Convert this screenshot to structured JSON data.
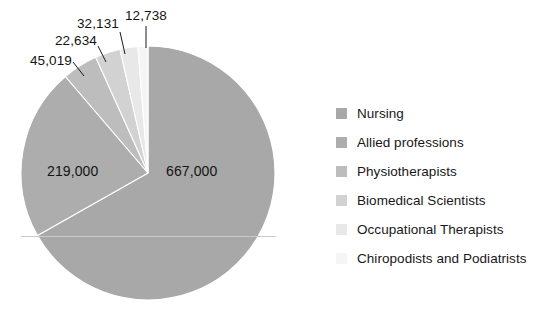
{
  "chart_data": {
    "type": "pie",
    "title": "",
    "subtitle": "",
    "xlabel": "",
    "ylabel": "",
    "legend_position": "right",
    "grid": false,
    "total": 998522,
    "categories": [
      "Nursing",
      "Allied professions",
      "Physiotherapists",
      "Biomedical Scientists",
      "Occupational Therapists",
      "Chiropodists and Podiatrists"
    ],
    "values": [
      667000,
      219000,
      45019,
      32131,
      22634,
      12738
    ],
    "labels": [
      "667,000",
      "219,000",
      "45,019",
      "32,131",
      "22,634",
      "12,738"
    ],
    "percentages": [
      66.8,
      21.93,
      4.51,
      3.22,
      2.27,
      1.28
    ],
    "colors": [
      "#a8a8a8",
      "#adadad",
      "#bdbdbd",
      "#d2d2d2",
      "#e8e8e8",
      "#f5f5f5"
    ],
    "slices": [
      {
        "name": "Nursing",
        "value": 667000,
        "label": "667,000",
        "color": "#a8a8a8",
        "percent": 66.8,
        "start_deg": 0.0,
        "sweep_deg": 240.48
      },
      {
        "name": "Allied professions",
        "value": 219000,
        "label": "219,000",
        "color": "#adadad",
        "percent": 21.93,
        "start_deg": 240.48,
        "sweep_deg": 78.96
      },
      {
        "name": "Physiotherapists",
        "value": 45019,
        "label": "45,019",
        "color": "#bdbdbd",
        "percent": 4.51,
        "start_deg": 319.44,
        "sweep_deg": 16.23
      },
      {
        "name": "Biomedical Scientists",
        "value": 32131,
        "label": "32,131",
        "color": "#d2d2d2",
        "percent": 3.22,
        "start_deg": 335.67,
        "sweep_deg": 11.58
      },
      {
        "name": "Occupational Therapists",
        "value": 22634,
        "label": "22,634",
        "color": "#e8e8e8",
        "percent": 2.27,
        "start_deg": 347.25,
        "sweep_deg": 8.16
      },
      {
        "name": "Chiropodists and Podiatrists",
        "value": 12738,
        "label": "12,738",
        "color": "#f5f5f5",
        "percent": 1.28,
        "start_deg": 355.41,
        "sweep_deg": 4.59
      }
    ]
  },
  "legend": {
    "items": [
      {
        "label": "Nursing",
        "color": "#a8a8a8"
      },
      {
        "label": "Allied professions",
        "color": "#adadad"
      },
      {
        "label": "Physiotherapists",
        "color": "#bdbdbd"
      },
      {
        "label": "Biomedical Scientists",
        "color": "#d2d2d2"
      },
      {
        "label": "Occupational Therapists",
        "color": "#e8e8e8"
      },
      {
        "label": "Chiropodists and Podiatrists",
        "color": "#f5f5f5"
      }
    ]
  },
  "value_labels": [
    {
      "text": "667,000",
      "x": 166,
      "y": 163,
      "placement": "inside"
    },
    {
      "text": "219,000",
      "x": 47,
      "y": 163,
      "placement": "inside"
    },
    {
      "text": "45,019",
      "x": 30,
      "y": 53,
      "placement": "outside"
    },
    {
      "text": "22,634",
      "x": 55,
      "y": 33,
      "placement": "outside"
    },
    {
      "text": "32,131",
      "x": 77,
      "y": 16,
      "placement": "outside"
    },
    {
      "text": "12,738",
      "x": 125,
      "y": 8,
      "placement": "outside"
    }
  ],
  "leader_lines": [
    {
      "x1": 73,
      "y1": 62,
      "x2": 84,
      "y2": 76
    },
    {
      "x1": 98,
      "y1": 46,
      "x2": 106,
      "y2": 62
    },
    {
      "x1": 120,
      "y1": 32,
      "x2": 125,
      "y2": 54
    },
    {
      "x1": 146,
      "y1": 26,
      "x2": 146,
      "y2": 48
    }
  ],
  "geometry": {
    "cx": 148,
    "cy": 173,
    "r": 127,
    "rotation_deg": 0
  },
  "style": {
    "background": "#ffffff",
    "label_color": "#141414",
    "legend_text_color": "#181818",
    "scanline_color": "#c4c4c4"
  }
}
